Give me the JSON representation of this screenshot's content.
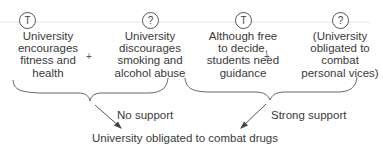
{
  "premises": [
    {
      "badge": "T",
      "text": "University\nencourages\nfitness and\nhealth"
    },
    {
      "badge": "?",
      "text": "University\ndiscourages\nsmoking and\nalcohol abuse"
    },
    {
      "badge": "T",
      "text": "Although free\nto decide,\nstudents need\nguidance"
    },
    {
      "badge": "?",
      "text": "(University\nobligated to\ncombat\npersonal vices)"
    }
  ],
  "operators": [
    "+",
    "+"
  ],
  "links": [
    {
      "label": "No support"
    },
    {
      "label": "Strong support"
    }
  ],
  "conclusion": "University obligated to combat drugs",
  "colors": {
    "line": "#555555",
    "text": "#3a3a3a",
    "rule": "#e2e2e2"
  }
}
